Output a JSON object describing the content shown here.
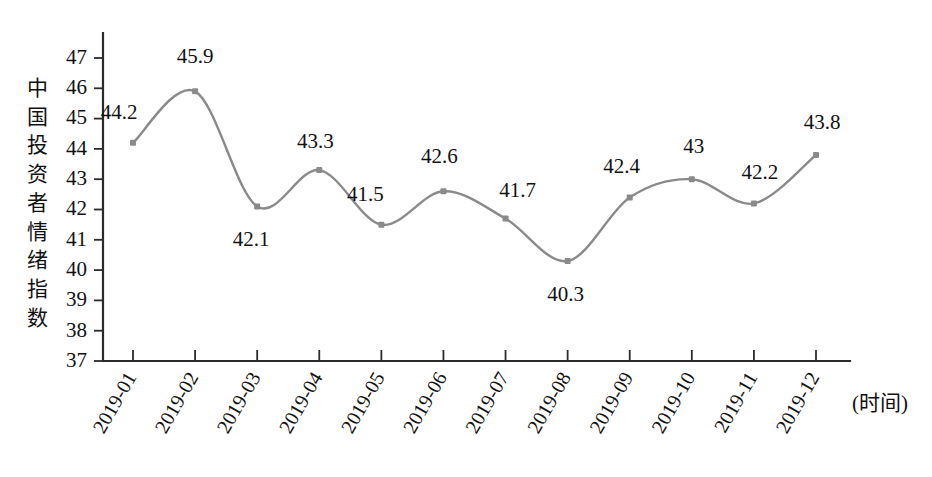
{
  "chart_data": {
    "type": "line",
    "title": "",
    "subtitle": "",
    "xlabel": "(时间)",
    "ylabel": "中国投资者情绪指数",
    "categories": [
      "2019-01",
      "2019-02",
      "2019-03",
      "2019-04",
      "2019-05",
      "2019-06",
      "2019-07",
      "2019-08",
      "2019-09",
      "2019-10",
      "2019-11",
      "2019-12"
    ],
    "values": [
      44.2,
      45.9,
      42.1,
      43.3,
      41.5,
      42.6,
      41.7,
      40.3,
      42.4,
      43,
      42.2,
      43.8
    ],
    "point_labels": [
      "44.2",
      "45.9",
      "42.1",
      "43.3",
      "41.5",
      "42.6",
      "41.7",
      "40.3",
      "42.4",
      "43",
      "42.2",
      "43.8"
    ],
    "ylim": [
      37,
      47
    ],
    "yticks": [
      "37",
      "38",
      "39",
      "40",
      "41",
      "42",
      "43",
      "44",
      "45",
      "46",
      "47"
    ],
    "grid": false,
    "legend": false,
    "legend_position": "none",
    "series": [
      {
        "name": "中国投资者情绪指数",
        "values": [
          44.2,
          45.9,
          42.1,
          43.3,
          41.5,
          42.6,
          41.7,
          40.3,
          42.4,
          43,
          42.2,
          43.8
        ]
      }
    ],
    "annotations": []
  },
  "style": {
    "line_color": "#8a8a8a",
    "marker_color": "#8a8a8a",
    "axis_color": "#2b2b2b",
    "text_color": "#111111",
    "background": "#ffffff"
  },
  "axis": {
    "y_title_chars": [
      "中",
      "国",
      "投",
      "资",
      "者",
      "情",
      "绪",
      "指",
      "数"
    ],
    "x_caption": "(时间)"
  }
}
